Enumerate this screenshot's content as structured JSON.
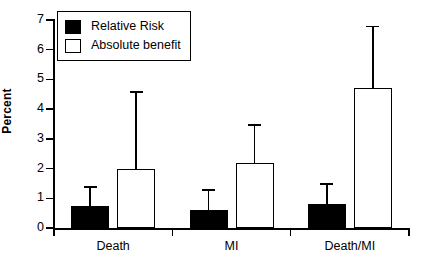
{
  "chart_data": {
    "type": "bar",
    "title": "",
    "subtitle": "",
    "xlabel": "",
    "ylabel": "Percent",
    "ylim": [
      0,
      7
    ],
    "yticks": [
      0,
      1,
      2,
      3,
      4,
      5,
      6,
      7
    ],
    "ytick_labels": [
      "0",
      "1",
      "2",
      "3",
      "4",
      "5",
      "6",
      "7"
    ],
    "grid": false,
    "legend_position": "top-left",
    "categories": [
      "Death",
      "MI",
      "Death/MI"
    ],
    "series": [
      {
        "name": "Relative Risk",
        "color": "#000000",
        "fill": "solid-black",
        "values": [
          0.75,
          0.6,
          0.8
        ],
        "error_high": [
          1.4,
          1.3,
          1.5
        ]
      },
      {
        "name": "Absolute benefit",
        "color": "#ffffff",
        "fill": "white-with-black-outline",
        "values": [
          2.0,
          2.2,
          4.7
        ],
        "error_high": [
          4.6,
          3.5,
          6.8
        ]
      }
    ],
    "error_bar_style": "upper-only-with-cap"
  },
  "legend": {
    "items": [
      {
        "label": "Relative Risk",
        "swatch": "dark"
      },
      {
        "label": "Absolute benefit",
        "swatch": "light"
      }
    ]
  }
}
